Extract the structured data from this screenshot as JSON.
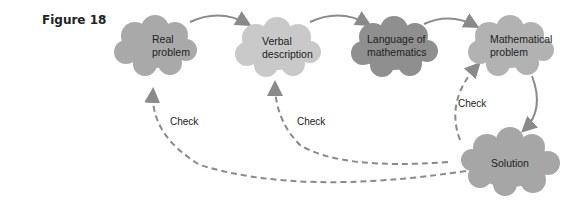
{
  "figure": {
    "label": "Figure 18"
  },
  "nodes": [
    {
      "id": "real",
      "lines": [
        "Real",
        "problem"
      ],
      "color": "#a9a9a9"
    },
    {
      "id": "verbal",
      "lines": [
        "Verbal",
        "description"
      ],
      "color": "#c9c9c9"
    },
    {
      "id": "language",
      "lines": [
        "Language of",
        "mathematics"
      ],
      "color": "#8f8f8f"
    },
    {
      "id": "mathematical",
      "lines": [
        "Mathematical",
        "problem"
      ],
      "color": "#b2b2b2"
    },
    {
      "id": "solution",
      "lines": [
        "Solution"
      ],
      "color": "#a6a6a6"
    }
  ],
  "edges": {
    "forward_color": "#8a8a8a",
    "check_color": "#8a8a8a",
    "check_labels": [
      "Check",
      "Check",
      "Check"
    ]
  }
}
